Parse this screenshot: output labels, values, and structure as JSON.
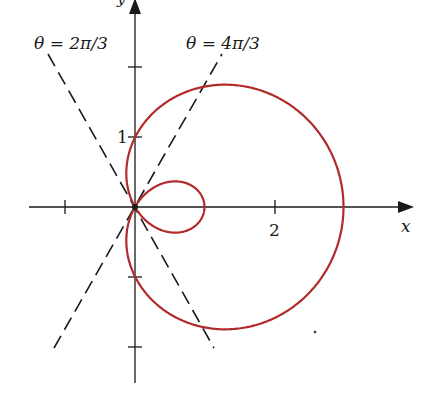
{
  "chart_data": {
    "type": "line",
    "title": "",
    "equation": "r = 1 + 2cos θ",
    "xlabel": "x",
    "ylabel": "y",
    "x_ticks": [
      -1,
      2
    ],
    "x_tick_labels": [
      "",
      "2"
    ],
    "y_ticks": [
      2,
      1,
      -1,
      -2
    ],
    "y_tick_labels": [
      "",
      "1",
      "",
      ""
    ],
    "xlim": [
      -1.6,
      4.0
    ],
    "ylim": [
      -2.5,
      3.0
    ],
    "grid": false,
    "series": [
      {
        "name": "limaçon r = 1 + 2cos θ",
        "color": "#b22a2a",
        "theta_range": [
          0,
          6.2832
        ],
        "key_points": [
          {
            "x": 3,
            "y": 0
          },
          {
            "x": 1,
            "y": 0
          },
          {
            "x": 0,
            "y": 1
          },
          {
            "x": 0,
            "y": -1
          },
          {
            "x": 0,
            "y": 0
          }
        ]
      },
      {
        "name": "line θ = 2π/3",
        "style": "dashed",
        "color": "#1a1a1a",
        "angle_deg": 120
      },
      {
        "name": "line θ = 4π/3",
        "style": "dashed",
        "color": "#1a1a1a",
        "angle_deg": 240
      }
    ],
    "annotations": [
      {
        "text": "θ = 2π/3",
        "position": "top-left"
      },
      {
        "text": "θ = 4π/3",
        "position": "top-center"
      }
    ]
  },
  "labels": {
    "x_axis": "x",
    "y_axis": "y",
    "tick_x_2": "2",
    "tick_y_1": "1",
    "line1": "θ = 2π/3",
    "line2": "θ = 4π/3"
  },
  "colors": {
    "curve": "#b22a2a",
    "axes": "#1a1a1a"
  }
}
